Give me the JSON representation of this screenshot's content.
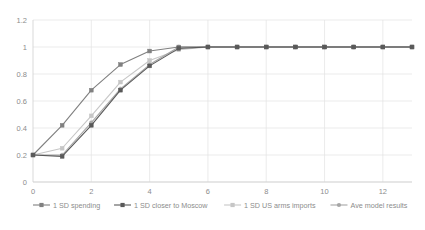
{
  "chart_data": {
    "type": "line",
    "title": "",
    "subtitle": "",
    "xlabel": "",
    "ylabel": "",
    "xlim": [
      0,
      13
    ],
    "ylim": [
      0,
      1.2
    ],
    "grid": true,
    "legend_position": "bottom",
    "x": [
      0,
      1,
      2,
      3,
      4,
      5,
      6,
      7,
      8,
      9,
      10,
      11,
      12,
      13
    ],
    "xticks": [
      "0",
      "2",
      "4",
      "6",
      "8",
      "10",
      "12"
    ],
    "xtick_values": [
      0,
      2,
      4,
      6,
      8,
      10,
      12
    ],
    "yticks": [
      "0",
      "0.2",
      "0.4",
      "0.6",
      "0.8",
      "1",
      "1.2"
    ],
    "ytick_values": [
      0,
      0.2,
      0.4,
      0.6,
      0.8,
      1,
      1.2
    ],
    "series": [
      {
        "name": "1 SD spending",
        "color": "#808080",
        "marker": "square",
        "values": [
          0.2,
          0.42,
          0.68,
          0.87,
          0.97,
          1.0,
          1.0,
          1.0,
          1.0,
          1.0,
          1.0,
          1.0,
          1.0,
          1.0
        ]
      },
      {
        "name": "1 SD closer to Moscow",
        "color": "#595959",
        "marker": "square",
        "values": [
          0.2,
          0.19,
          0.42,
          0.68,
          0.86,
          0.99,
          1.0,
          1.0,
          1.0,
          1.0,
          1.0,
          1.0,
          1.0,
          1.0
        ]
      },
      {
        "name": "1 SD US arms imports",
        "color": "#c6c6c6",
        "marker": "square",
        "values": [
          0.2,
          0.25,
          0.49,
          0.74,
          0.9,
          0.98,
          1.0,
          1.0,
          1.0,
          1.0,
          1.0,
          1.0,
          1.0,
          1.0
        ]
      },
      {
        "name": "Ave model results",
        "color": "#a6a6a6",
        "marker": "circle",
        "values": [
          0.2,
          0.2,
          0.44,
          0.69,
          0.87,
          1.0,
          1.0,
          1.0,
          1.0,
          1.0,
          1.0,
          1.0,
          1.0,
          1.0
        ]
      }
    ]
  },
  "legend": {
    "items": [
      {
        "label": "1 SD spending",
        "color": "#808080"
      },
      {
        "label": "1 SD closer to Moscow",
        "color": "#595959"
      },
      {
        "label": "1 SD US arms imports",
        "color": "#c6c6c6"
      },
      {
        "label": "Ave model results",
        "color": "#a6a6a6"
      }
    ]
  },
  "axes": {
    "y_tick_labels": [
      "1.2",
      "1",
      "0.8",
      "0.6",
      "0.4",
      "0.2",
      "0"
    ],
    "x_tick_labels": [
      "0",
      "2",
      "4",
      "6",
      "8",
      "10",
      "12"
    ]
  },
  "colors": {
    "background": "#ffffff",
    "grid": "#e2e2e2",
    "axis": "#cfcfcf",
    "text": "#8c8c8c"
  }
}
